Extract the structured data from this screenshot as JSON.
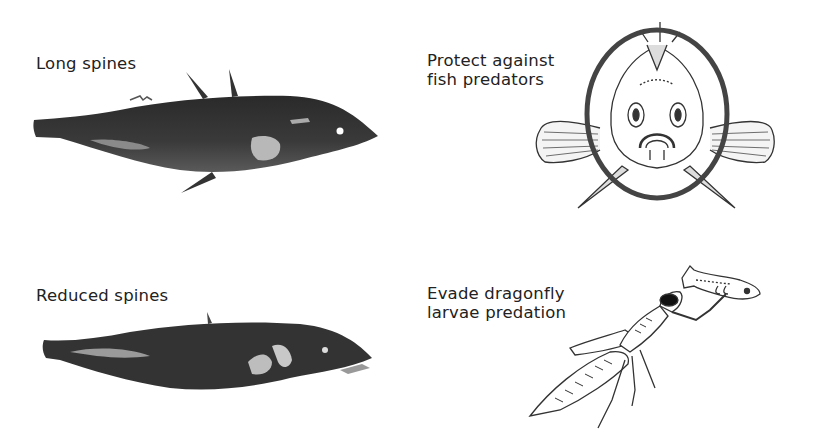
{
  "panels": [
    {
      "id": "long-spines",
      "label": "Long spines",
      "kind": "photo-fish"
    },
    {
      "id": "protect-fish",
      "label": "Protect against\nfish predators",
      "kind": "front-view-drawing"
    },
    {
      "id": "reduced-spines",
      "label": "Reduced spines",
      "kind": "photo-fish"
    },
    {
      "id": "evade-dragonfly",
      "label": "Evade dragonfly\nlarvae predation",
      "kind": "dragonfly-larva-drawing"
    }
  ]
}
